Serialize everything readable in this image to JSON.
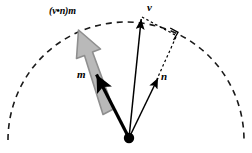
{
  "figure": {
    "type": "vector-projection-diagram",
    "background_color": "#ffffff",
    "width": 252,
    "height": 153,
    "labels": {
      "v": "v",
      "m": "m",
      "n": "n",
      "projection": "(v•n)m"
    },
    "colors": {
      "stroke": "#000000",
      "gray_arrow_fill": "#b3b3b3",
      "gray_arrow_stroke": "#8c8c8c",
      "arc": "#1a1a1a"
    },
    "geometry": {
      "origin": {
        "x": 129,
        "y": 138
      },
      "origin_dot_radius": 5,
      "arc": {
        "center_x": 126,
        "center_y": 140,
        "radius": 118,
        "style": "dashed",
        "dash_pattern": "6 5"
      },
      "vectors": [
        {
          "name": "v",
          "from": {
            "x": 129,
            "y": 138
          },
          "to": {
            "x": 141,
            "y": 16
          },
          "style": "solid",
          "color": "#000000"
        },
        {
          "name": "m",
          "from": {
            "x": 129,
            "y": 138
          },
          "to": {
            "x": 95,
            "y": 72
          },
          "style": "solid-thick",
          "color": "#000000"
        },
        {
          "name": "n",
          "from": {
            "x": 129,
            "y": 138
          },
          "to": {
            "x": 159,
            "y": 75
          },
          "style": "solid",
          "color": "#000000"
        },
        {
          "name": "projection",
          "from": {
            "x": 108,
            "y": 112
          },
          "to": {
            "x": 79,
            "y": 32
          },
          "style": "block-arrow",
          "color": "#b3b3b3"
        }
      ],
      "dotted_lines": [
        {
          "from": {
            "x": 141,
            "y": 16
          },
          "to": {
            "x": 176,
            "y": 35
          }
        },
        {
          "from": {
            "x": 176,
            "y": 35
          },
          "to": {
            "x": 159,
            "y": 75
          }
        }
      ],
      "right_angle_marker": {
        "x": 170,
        "y": 31,
        "size": 9
      }
    }
  }
}
